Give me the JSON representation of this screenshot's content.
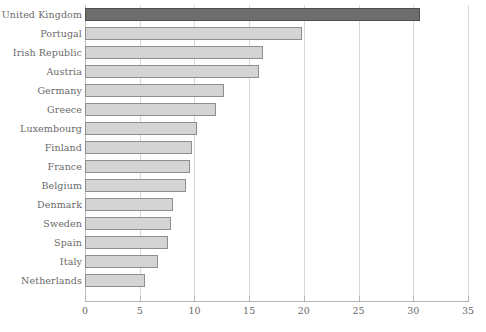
{
  "chart_data": {
    "type": "bar",
    "orientation": "horizontal",
    "title": "",
    "xlabel": "",
    "ylabel": "",
    "xlim": [
      0,
      35
    ],
    "xticks": [
      0,
      5,
      10,
      15,
      20,
      25,
      30,
      35
    ],
    "xtick_labels": [
      "0",
      "5",
      "10",
      "15",
      "20",
      "25",
      "30",
      "35"
    ],
    "grid": "vertical",
    "legend": "none",
    "categories": [
      "United  Kingdom",
      "Portugal",
      "Irish  Republic",
      "Austria",
      "Germany",
      "Greece",
      "Luxembourg",
      "Finland",
      "France",
      "Belgium",
      "Denmark",
      "Sweden",
      "Spain",
      "Italy",
      "Netherlands"
    ],
    "values": [
      30.6,
      19.8,
      16.3,
      15.9,
      12.7,
      12.0,
      10.2,
      9.8,
      9.6,
      9.2,
      8.0,
      7.9,
      7.6,
      6.7,
      5.5
    ],
    "highlight_index": 0,
    "colors": {
      "bar_fill": "#d4d4d4",
      "bar_border": "#8e8e8e",
      "highlight_fill": "#6e6e6e",
      "highlight_border": "#4f4f4f",
      "gridline": "#d8d8d8",
      "axis": "#b4b4b4",
      "text": "#6a6a6a",
      "background": "#ffffff"
    }
  }
}
